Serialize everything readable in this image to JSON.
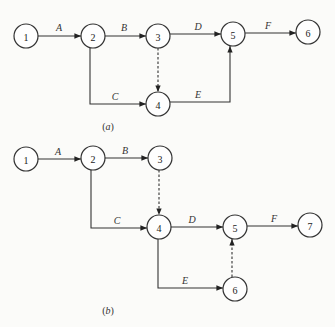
{
  "diagrams": [
    {
      "id": "a",
      "caption": "(a)",
      "caption_letter": "a",
      "nodes": [
        {
          "id": "1",
          "x": 26,
          "y": 36
        },
        {
          "id": "2",
          "x": 93,
          "y": 36
        },
        {
          "id": "3",
          "x": 158,
          "y": 36
        },
        {
          "id": "4",
          "x": 158,
          "y": 104
        },
        {
          "id": "5",
          "x": 233,
          "y": 34
        },
        {
          "id": "6",
          "x": 308,
          "y": 32
        }
      ],
      "edges": [
        {
          "from": "1",
          "to": "2",
          "label": "A",
          "type": "activity"
        },
        {
          "from": "2",
          "to": "3",
          "label": "B",
          "type": "activity"
        },
        {
          "from": "2",
          "to": "4",
          "label": "C",
          "type": "activity"
        },
        {
          "from": "3",
          "to": "4",
          "label": "",
          "type": "dummy"
        },
        {
          "from": "3",
          "to": "5",
          "label": "D",
          "type": "activity"
        },
        {
          "from": "4",
          "to": "5",
          "label": "E",
          "type": "activity"
        },
        {
          "from": "5",
          "to": "6",
          "label": "F",
          "type": "activity"
        }
      ]
    },
    {
      "id": "b",
      "caption": "(b)",
      "caption_letter": "b",
      "nodes": [
        {
          "id": "1",
          "x": 26,
          "y": 159
        },
        {
          "id": "2",
          "x": 93,
          "y": 158
        },
        {
          "id": "3",
          "x": 160,
          "y": 158
        },
        {
          "id": "4",
          "x": 159,
          "y": 227
        },
        {
          "id": "5",
          "x": 235,
          "y": 227
        },
        {
          "id": "6",
          "x": 235,
          "y": 289
        },
        {
          "id": "7",
          "x": 310,
          "y": 225
        }
      ],
      "edges": [
        {
          "from": "1",
          "to": "2",
          "label": "A",
          "type": "activity"
        },
        {
          "from": "2",
          "to": "3",
          "label": "B",
          "type": "activity"
        },
        {
          "from": "2",
          "to": "4",
          "label": "C",
          "type": "activity"
        },
        {
          "from": "3",
          "to": "4",
          "label": "",
          "type": "dummy"
        },
        {
          "from": "4",
          "to": "5",
          "label": "D",
          "type": "activity"
        },
        {
          "from": "4",
          "to": "6",
          "label": "E",
          "type": "activity"
        },
        {
          "from": "6",
          "to": "5",
          "label": "",
          "type": "dummy"
        },
        {
          "from": "5",
          "to": "7",
          "label": "F",
          "type": "activity"
        }
      ]
    }
  ],
  "labels": {
    "a": {
      "A": "A",
      "B": "B",
      "C": "C",
      "D": "D",
      "E": "E",
      "F": "F"
    },
    "b": {
      "A": "A",
      "B": "B",
      "C": "C",
      "D": "D",
      "E": "E",
      "F": "F"
    }
  },
  "node_labels": {
    "a": [
      "1",
      "2",
      "3",
      "4",
      "5",
      "6"
    ],
    "b": [
      "1",
      "2",
      "3",
      "4",
      "5",
      "6",
      "7"
    ]
  }
}
